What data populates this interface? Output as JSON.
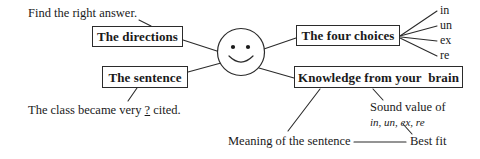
{
  "diagram": {
    "title_note": "Find the right answer.",
    "example_sentence_prefix": "The class became very ",
    "example_sentence_blank": "?",
    "example_sentence_suffix": " cited.",
    "center_icon": "smiley-face-icon",
    "boxes": {
      "directions": "The directions",
      "sentence": "The sentence",
      "four_choices": "The four choices",
      "knowledge": "Knowledge from your  brain"
    },
    "choices": [
      {
        "label": "in"
      },
      {
        "label": "un"
      },
      {
        "label": "ex"
      },
      {
        "label": "re"
      }
    ],
    "annotations": {
      "sound_value": "Sound value of",
      "sound_value_items": "in, un, ex, re",
      "meaning": "Meaning of the sentence",
      "best_fit": "Best fit"
    },
    "colors": {
      "ink": "#1a1a1a",
      "stroke": "#2b2b2b",
      "background": "#ffffff"
    }
  }
}
